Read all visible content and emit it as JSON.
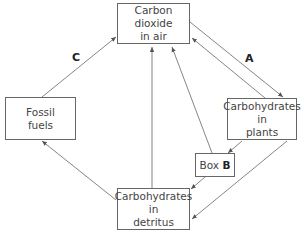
{
  "diagram": {
    "nodes": {
      "co2_air": {
        "lines": [
          "Carbon",
          "dioxide",
          "in air"
        ]
      },
      "fossil_fuels": {
        "lines": [
          "Fossil",
          "fuels"
        ]
      },
      "plants": {
        "lines": [
          "Carbohydrates",
          "in",
          "plants"
        ]
      },
      "detritus": {
        "lines": [
          "Carbohydrates",
          "in",
          "detritus"
        ]
      },
      "box_b": {
        "prefix": "Box",
        "letter": "B"
      }
    },
    "labels": {
      "a": "A",
      "c": "C"
    },
    "edges": [
      {
        "from": "co2_air",
        "to": "plants",
        "label": "A"
      },
      {
        "from": "plants",
        "to": "co2_air"
      },
      {
        "from": "fossil_fuels",
        "to": "co2_air",
        "label": "C"
      },
      {
        "from": "detritus",
        "to": "co2_air"
      },
      {
        "from": "box_b",
        "to": "co2_air"
      },
      {
        "from": "plants",
        "to": "box_b"
      },
      {
        "from": "box_b",
        "to": "detritus"
      },
      {
        "from": "plants",
        "to": "detritus"
      },
      {
        "from": "detritus",
        "to": "fossil_fuels"
      }
    ]
  }
}
